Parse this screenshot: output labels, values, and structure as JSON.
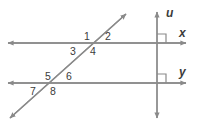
{
  "figure": {
    "type": "geometry-diagram",
    "stroke_color": "#8a8a8a",
    "label_color": "#3b3b3b",
    "background_color": "#ffffff",
    "line_labels": {
      "vertical": "u",
      "upper_horizontal": "x",
      "lower_horizontal": "y"
    },
    "angle_labels": {
      "a1": "1",
      "a2": "2",
      "a3": "3",
      "a4": "4",
      "a5": "5",
      "a6": "6",
      "a7": "7",
      "a8": "8"
    },
    "right_angle_markers": 2
  }
}
